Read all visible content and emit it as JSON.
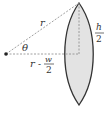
{
  "diagram": {
    "title": "",
    "colors": {
      "lens_fill": "#e3e3e3",
      "lens_stroke": "#333333",
      "dashed": "#888888",
      "text": "#333333"
    },
    "labels": {
      "radius": "r",
      "angle": "θ",
      "half_height_num": "h",
      "half_height_den": "2",
      "offset_r": "r",
      "offset_minus": "-",
      "offset_num": "w",
      "offset_den": "2"
    }
  }
}
